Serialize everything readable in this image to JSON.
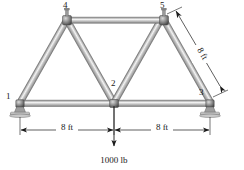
{
  "figure": {
    "background_color": "#ffffff",
    "member_color": "#a8a8a8",
    "member_edge_color": "#6e6e6e",
    "member_highlight_color": "#f0f0f0",
    "annotation_color": "#1a1a1a"
  },
  "nodes": [
    {
      "id": "1",
      "label": "1",
      "x": 20,
      "y": 103,
      "label_x": 6,
      "label_y": 99,
      "support": "pin"
    },
    {
      "id": "2",
      "label": "2",
      "x": 114,
      "y": 103,
      "label_x": 111,
      "label_y": 83,
      "support": "none"
    },
    {
      "id": "3",
      "label": "3",
      "x": 210,
      "y": 103,
      "label_x": 200,
      "label_y": 94,
      "support": "roller"
    },
    {
      "id": "4",
      "label": "4",
      "x": 67,
      "y": 20,
      "label_x": 64,
      "label_y": 9,
      "support": "none"
    },
    {
      "id": "5",
      "label": "5",
      "x": 164,
      "y": 20,
      "label_x": 161,
      "label_y": 9,
      "support": "none"
    }
  ],
  "members": [
    {
      "from": "1",
      "to": "4"
    },
    {
      "from": "1",
      "to": "2"
    },
    {
      "from": "4",
      "to": "2"
    },
    {
      "from": "4",
      "to": "5"
    },
    {
      "from": "2",
      "to": "5"
    },
    {
      "from": "2",
      "to": "3"
    },
    {
      "from": "5",
      "to": "3"
    }
  ],
  "dimensions": [
    {
      "id": "left-span",
      "label": "8 ft",
      "label_x": 67,
      "label_y": 127,
      "x1": 20,
      "x2": 114,
      "y": 130
    },
    {
      "id": "right-span",
      "label": "8 ft",
      "label_x": 162,
      "label_y": 127,
      "x1": 114,
      "x2": 210,
      "y": 130
    },
    {
      "id": "diagonal-member-5-3",
      "label": "8 ft",
      "label_x": 201,
      "label_y": 55,
      "rotation_deg": 62
    }
  ],
  "load": {
    "label": "1000 lb",
    "label_x": 114,
    "label_y": 162,
    "magnitude": 1000,
    "unit": "lb",
    "direction": "down",
    "applied_at_node": "2",
    "arrow_x": 114,
    "arrow_y_start": 105,
    "arrow_y_end": 147
  }
}
